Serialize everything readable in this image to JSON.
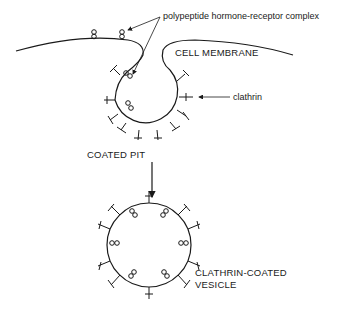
{
  "diagram": {
    "labels": {
      "complex": "polypeptide hormone-receptor complex",
      "membrane": "CELL MEMBRANE",
      "clathrin": "clathrin",
      "coated_pit": "COATED PIT",
      "vesicle_line1": "CLATHRIN-COATED",
      "vesicle_line2": "VESICLE"
    },
    "stroke_color": "#1a1a1a",
    "background": "#ffffff"
  }
}
